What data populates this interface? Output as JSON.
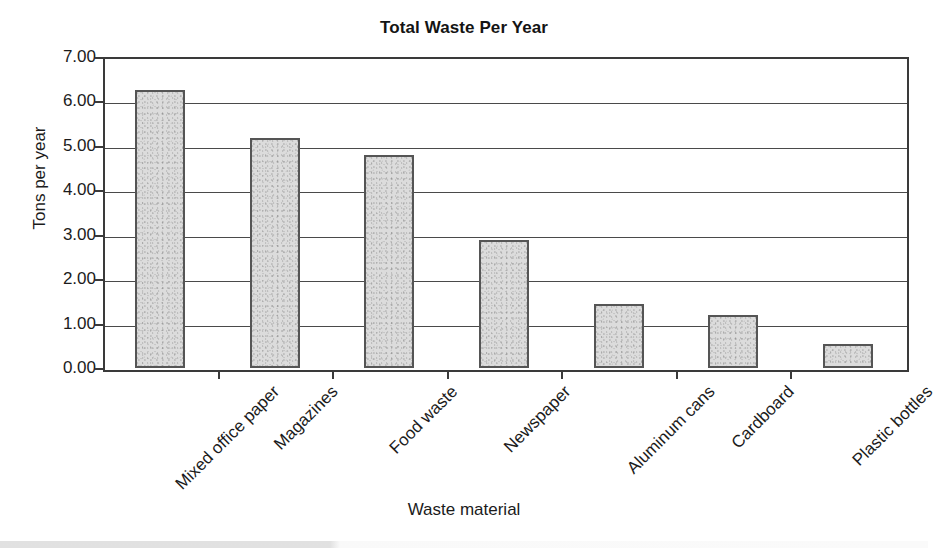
{
  "chart_data": {
    "type": "bar",
    "title": "Total Waste Per Year",
    "xlabel": "Waste material",
    "ylabel": "Tons per year",
    "categories": [
      "Mixed office paper",
      "Magazines",
      "Food waste",
      "Newspaper",
      "Aluminum cans",
      "Cardboard",
      "Plastic bottles"
    ],
    "values": [
      6.25,
      5.17,
      4.8,
      2.88,
      1.45,
      1.2,
      0.53
    ],
    "ylim": [
      0.0,
      7.0
    ],
    "ytick_values": [
      0.0,
      1.0,
      2.0,
      3.0,
      4.0,
      5.0,
      6.0,
      7.0
    ],
    "ytick_labels": [
      "0.00",
      "1.00",
      "2.00",
      "3.00",
      "4.00",
      "5.00",
      "6.00",
      "7.00"
    ],
    "grid": "horizontal",
    "legend": "none",
    "bar_fill_color": "#dcdcdc",
    "bar_border_color": "#555555",
    "axis_color": "#3a3a3a",
    "xtick_label_rotation": -45
  }
}
